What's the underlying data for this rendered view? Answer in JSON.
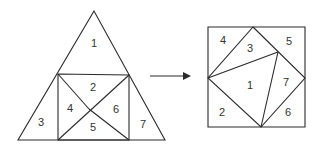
{
  "diagram": {
    "colors": {
      "stroke": "#2a2a2a",
      "text": "#333333",
      "background": "#ffffff"
    },
    "triangle": {
      "pieces": [
        {
          "id": "1",
          "label": "1",
          "x": 94,
          "y": 43
        },
        {
          "id": "2",
          "label": "2",
          "x": 93,
          "y": 87
        },
        {
          "id": "3",
          "label": "3",
          "x": 41,
          "y": 122
        },
        {
          "id": "4",
          "label": "4",
          "x": 70,
          "y": 108
        },
        {
          "id": "5",
          "label": "5",
          "x": 93,
          "y": 127
        },
        {
          "id": "6",
          "label": "6",
          "x": 116,
          "y": 109
        },
        {
          "id": "7",
          "label": "7",
          "x": 143,
          "y": 124
        }
      ]
    },
    "arrow": {
      "from_x": 150,
      "to_x": 190,
      "y": 76
    },
    "square": {
      "pieces": [
        {
          "id": "4",
          "label": "4",
          "x": 223,
          "y": 40
        },
        {
          "id": "3",
          "label": "3",
          "x": 250,
          "y": 48
        },
        {
          "id": "5",
          "label": "5",
          "x": 289,
          "y": 41
        },
        {
          "id": "1",
          "label": "1",
          "x": 250,
          "y": 85
        },
        {
          "id": "7",
          "label": "7",
          "x": 286,
          "y": 82
        },
        {
          "id": "2",
          "label": "2",
          "x": 222,
          "y": 112
        },
        {
          "id": "6",
          "label": "6",
          "x": 288,
          "y": 112
        }
      ]
    }
  }
}
